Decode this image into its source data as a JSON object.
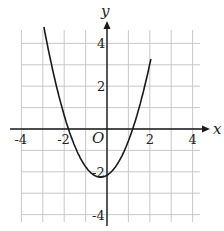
{
  "chart_data": {
    "type": "line",
    "title": "",
    "xlabel": "x",
    "ylabel": "y",
    "origin_label": "O",
    "xlim": [
      -4.5,
      4.5
    ],
    "ylim": [
      -4.5,
      4.5
    ],
    "grid": true,
    "x_ticks": [
      {
        "value": -4,
        "label": "-4"
      },
      {
        "value": -2,
        "label": "-2"
      },
      {
        "value": 2,
        "label": "2"
      },
      {
        "value": 4,
        "label": "4"
      }
    ],
    "y_ticks": [
      {
        "value": 4,
        "label": "4"
      },
      {
        "value": 2,
        "label": "2"
      },
      {
        "value": -2,
        "label": "-2"
      },
      {
        "value": -4,
        "label": "-4"
      }
    ],
    "series": [
      {
        "name": "parabola",
        "equation_estimate": "y = x^2 + 0.6x - 2.16",
        "roots": [
          -1.8,
          1.2
        ],
        "vertex": [
          -0.3,
          -2.25
        ],
        "y_intercept": -2.16,
        "x": [
          -3.3,
          -3,
          -2.5,
          -2,
          -1.8,
          -1.5,
          -1,
          -0.5,
          -0.3,
          0,
          0.5,
          1,
          1.2,
          1.5,
          2,
          2.4
        ],
        "values": [
          6.75,
          5.04,
          2.59,
          0.64,
          0.0,
          -0.81,
          -1.76,
          -2.16,
          -2.25,
          -2.16,
          -1.61,
          -0.56,
          0.0,
          0.99,
          3.04,
          4.97
        ]
      }
    ]
  }
}
